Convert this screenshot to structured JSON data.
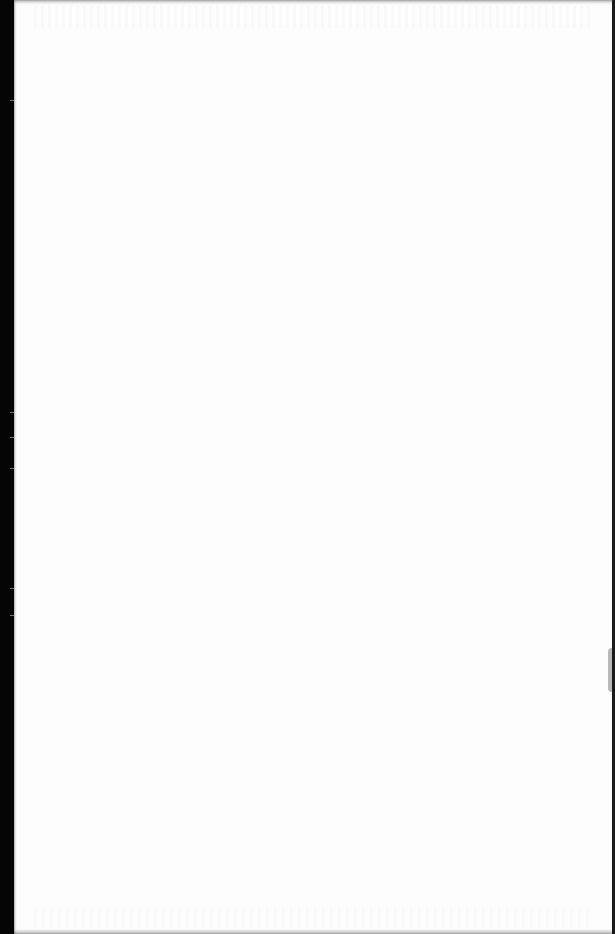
{
  "document": {
    "type": "scanned-page",
    "content": "",
    "is_blank": true
  },
  "colors": {
    "page": "#fdfdfd",
    "scanner_margin": "#000000"
  }
}
